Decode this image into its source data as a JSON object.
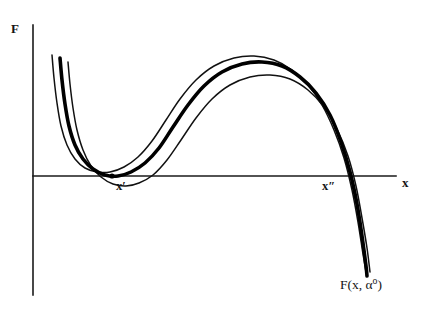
{
  "figure": {
    "title_visible": false,
    "background_color": "#ffffff",
    "stroke_color": "#000000",
    "axes": {
      "y_axis_label": "F",
      "x_axis_label": "x",
      "y_axis": {
        "x": 33,
        "y_top": 25,
        "y_bottom": 295
      },
      "x_axis": {
        "y": 176,
        "x_left": 33,
        "x_right": 396
      }
    },
    "annotations": {
      "tangency_point_label_base": "x",
      "tangency_point_label_prime": "′",
      "crossing_point_label_base": "x",
      "crossing_point_label_prime": "″",
      "curve_label_base": "F(x, α",
      "curve_label_sup": "o",
      "curve_label_close": ")"
    }
  },
  "chart_data": {
    "type": "line",
    "title": "",
    "xlabel": "x",
    "ylabel": "F",
    "grid": false,
    "legend": "none",
    "axis_pixel_frame": {
      "x_axis_y": 176,
      "y_axis_x": 33
    },
    "series": [
      {
        "name": "upper-thin-curve",
        "style": "thin",
        "stroke_width": 1.5,
        "points": [
          [
            52,
            55
          ],
          [
            54,
            78
          ],
          [
            57,
            103
          ],
          [
            61,
            126
          ],
          [
            67,
            145
          ],
          [
            75,
            159
          ],
          [
            85,
            168
          ],
          [
            97,
            172
          ],
          [
            110,
            172
          ],
          [
            124,
            167
          ],
          [
            138,
            157
          ],
          [
            152,
            141
          ],
          [
            166,
            120
          ],
          [
            180,
            99
          ],
          [
            196,
            80
          ],
          [
            214,
            66
          ],
          [
            234,
            58
          ],
          [
            254,
            56
          ],
          [
            274,
            60
          ],
          [
            292,
            70
          ],
          [
            308,
            85
          ],
          [
            322,
            105
          ],
          [
            334,
            130
          ],
          [
            344,
            158
          ],
          [
            352,
            190
          ],
          [
            358,
            222
          ],
          [
            363,
            254
          ],
          [
            366,
            272
          ]
        ]
      },
      {
        "name": "middle-thick-curve",
        "style": "thick",
        "stroke_width": 3.6,
        "label": "F(x, α°)",
        "points": [
          [
            60,
            58
          ],
          [
            62,
            80
          ],
          [
            65,
            104
          ],
          [
            69,
            126
          ],
          [
            75,
            145
          ],
          [
            83,
            159
          ],
          [
            93,
            169
          ],
          [
            105,
            175
          ],
          [
            118,
            176
          ],
          [
            131,
            172
          ],
          [
            145,
            163
          ],
          [
            159,
            148
          ],
          [
            173,
            127
          ],
          [
            188,
            105
          ],
          [
            204,
            86
          ],
          [
            222,
            72
          ],
          [
            242,
            64
          ],
          [
            262,
            62
          ],
          [
            282,
            66
          ],
          [
            300,
            77
          ],
          [
            316,
            93
          ],
          [
            330,
            115
          ],
          [
            341,
            142
          ],
          [
            350,
            172
          ],
          [
            357,
            204
          ],
          [
            362,
            236
          ],
          [
            366,
            266
          ],
          [
            367,
            276
          ]
        ]
      },
      {
        "name": "lower-thin-curve",
        "style": "thin",
        "stroke_width": 1.5,
        "points": [
          [
            68,
            62
          ],
          [
            70,
            84
          ],
          [
            73,
            108
          ],
          [
            77,
            130
          ],
          [
            83,
            150
          ],
          [
            91,
            166
          ],
          [
            101,
            177
          ],
          [
            113,
            184
          ],
          [
            126,
            186
          ],
          [
            139,
            183
          ],
          [
            153,
            175
          ],
          [
            167,
            160
          ],
          [
            181,
            140
          ],
          [
            196,
            118
          ],
          [
            212,
            99
          ],
          [
            230,
            85
          ],
          [
            250,
            77
          ],
          [
            270,
            75
          ],
          [
            290,
            79
          ],
          [
            308,
            90
          ],
          [
            324,
            107
          ],
          [
            337,
            129
          ],
          [
            348,
            156
          ],
          [
            356,
            186
          ],
          [
            362,
            218
          ],
          [
            367,
            248
          ],
          [
            370,
            272
          ]
        ]
      }
    ],
    "markers": [
      {
        "name": "tangency-point",
        "x_px": 112,
        "y_px": 176,
        "label": "x′"
      },
      {
        "name": "crossing-point",
        "x_px": 350,
        "y_px": 176,
        "label": "x″"
      }
    ]
  }
}
